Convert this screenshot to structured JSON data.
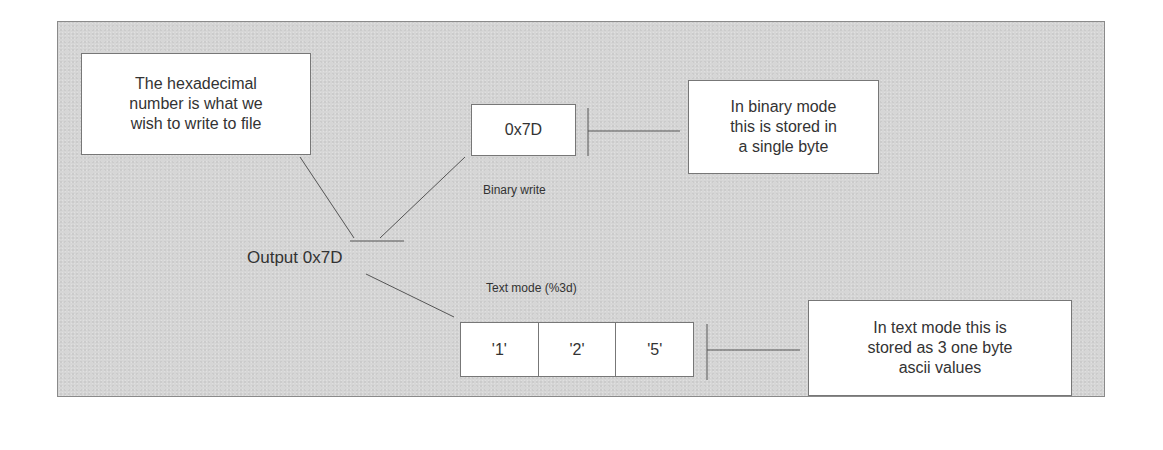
{
  "diagram": {
    "callouts": {
      "hex_note": "The hexadecimal number is what we wish to write to file",
      "binary_note": "In binary mode this is stored in a single byte",
      "text_note": "In text mode this is stored as 3 one byte ascii values"
    },
    "hex_note_lines": [
      "The hexadecimal",
      "number is what we",
      "wish to write to file"
    ],
    "binary_note_lines": [
      "In binary mode",
      "this is stored in",
      "a single byte"
    ],
    "text_note_lines": [
      "In text mode this is",
      "stored as 3 one byte",
      "ascii values"
    ],
    "binary_value": "0x7D",
    "binary_label": "Binary write",
    "output_label": "Output 0x7D",
    "text_mode_label": "Text mode (%3d)",
    "text_cells": [
      "'1'",
      "'2'",
      "'5'"
    ],
    "colors": {
      "panel_background": "#d6d6d6",
      "box_background": "#ffffff",
      "line": "#555555",
      "text": "#333333"
    }
  }
}
